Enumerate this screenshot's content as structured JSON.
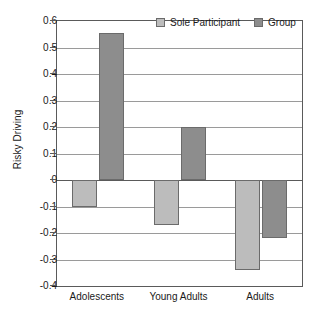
{
  "chart_data": {
    "type": "bar",
    "title": "",
    "subtitle": "",
    "xlabel": "",
    "ylabel": "Risky Driving",
    "categories": [
      "Adolescents",
      "Young Adults",
      "Adults"
    ],
    "series": [
      {
        "name": "Sole Participant",
        "color": "#bcbcbc",
        "values": [
          -0.1,
          -0.17,
          -0.34
        ]
      },
      {
        "name": "Group",
        "color": "#8d8d8d",
        "values": [
          0.555,
          0.2,
          -0.22
        ]
      }
    ],
    "ylim": [
      -0.4,
      0.6
    ],
    "ytick_values": [
      0.6,
      0.5,
      0.4,
      0.3,
      0.2,
      0.1,
      0,
      -0.1,
      -0.2,
      -0.3,
      -0.4
    ],
    "ytick_labels": [
      "0.6",
      "0.5",
      "0.4",
      "0.3",
      "0.2",
      "0.1",
      "0",
      "-0.1",
      "-0.2",
      "-0.3",
      "-0.4"
    ],
    "grid": true,
    "grid_axis": "y",
    "legend_position": "top-right",
    "zero_line": 0
  },
  "legend": {
    "items": [
      {
        "label": "Sole Participant",
        "color": "#bcbcbc"
      },
      {
        "label": "Group",
        "color": "#8d8d8d"
      }
    ]
  },
  "axes": {
    "y_title": "Risky Driving"
  }
}
